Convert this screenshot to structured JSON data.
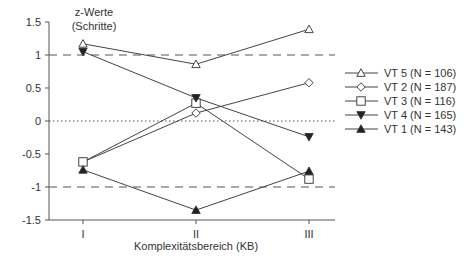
{
  "chart_data": {
    "type": "line",
    "title": "",
    "ylabel": "z-Werte (Schritte)",
    "ylabel_lines": [
      "z-Werte",
      "(Schritte)"
    ],
    "xlabel": "Komplexitätsbereich (KB)",
    "categories": [
      "I",
      "II",
      "III"
    ],
    "ylim": [
      -1.5,
      1.5
    ],
    "yticks": [
      1.5,
      1,
      0.5,
      0,
      -0.5,
      -1,
      -1.5
    ],
    "ytick_labels": [
      "1.5",
      "1",
      "0.5",
      "0",
      "-0.5",
      "-1",
      "-1.5"
    ],
    "reference_lines": [
      {
        "y": 1,
        "style": "dashed"
      },
      {
        "y": 0,
        "style": "dotted"
      },
      {
        "y": -1,
        "style": "dashed"
      }
    ],
    "grid": false,
    "legend_position": "right",
    "series": [
      {
        "name": "VT 5 (N = 106)",
        "marker": "triangle-up-open",
        "values": [
          1.17,
          0.86,
          1.39
        ]
      },
      {
        "name": "VT 2 (N = 187)",
        "marker": "diamond-open",
        "values": [
          -0.62,
          0.12,
          0.58
        ]
      },
      {
        "name": "VT 3 (N = 116)",
        "marker": "square-open",
        "values": [
          -0.62,
          0.27,
          -0.88
        ]
      },
      {
        "name": "VT 4 (N = 165)",
        "marker": "triangle-down-filled",
        "values": [
          1.05,
          0.35,
          -0.24
        ]
      },
      {
        "name": "VT 1 (N = 143)",
        "marker": "triangle-up-filled",
        "values": [
          -0.74,
          -1.35,
          -0.76
        ]
      }
    ]
  }
}
